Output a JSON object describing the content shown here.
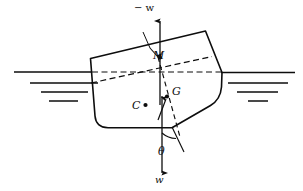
{
  "figure": {
    "kind": "naval-architecture-stability-diagram",
    "title": "",
    "labels": {
      "metacenter": "M",
      "center_of_buoyancy": "C",
      "center_of_gravity": "G",
      "heel_angle": "θ",
      "buoyancy_force": "− w",
      "weight_force": "w"
    },
    "colors": {
      "ink": "#0d0d0d",
      "background": "#ffffff"
    },
    "geometry": {
      "hull_outline": "M 90 58 L 205 31 L 222 72 L 221 88 Q 220 100 210 106 L 172 128 L 108 128 Q 96 128 95 116 L 90 58 Z",
      "hull_deck_line": [
        90,
        58,
        205,
        31
      ],
      "hull_bottom_y": 128,
      "waterline_y": 72,
      "waterline_left_x": [
        14,
        90
      ],
      "waterline_right_x": [
        222,
        295
      ],
      "heel_angle_degrees": 13,
      "axis_vertical_x": 160,
      "points": {
        "M": [
          160,
          57
        ],
        "C": [
          145,
          105
        ],
        "G": [
          167,
          96
        ]
      }
    },
    "water_hatch_left": [
      {
        "x1": 30,
        "x2": 98,
        "y": 83
      },
      {
        "x1": 41,
        "x2": 88,
        "y": 92
      },
      {
        "x1": 49,
        "x2": 78,
        "y": 101
      }
    ],
    "water_hatch_right": [
      {
        "x1": 228,
        "x2": 288,
        "y": 83
      },
      {
        "x1": 237,
        "x2": 278,
        "y": 92
      },
      {
        "x1": 248,
        "x2": 268,
        "y": 101
      }
    ]
  }
}
